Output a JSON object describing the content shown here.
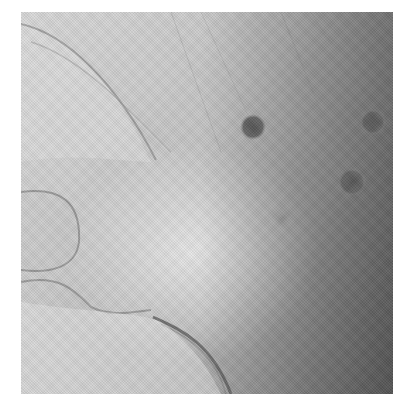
{
  "image": {
    "kind": "grayscale radiograph",
    "frame": {
      "x": 21,
      "y": 12,
      "width": 372,
      "height": 382
    },
    "palette": {
      "light": "#e6e6e6",
      "mid": "#b5b5b5",
      "dark": "#6e6e6e",
      "spot": "#5e5e5e"
    },
    "markers": [
      {
        "cx": 232,
        "cy": 115,
        "r": 13
      },
      {
        "cx": 352,
        "cy": 110,
        "r": 13
      },
      {
        "cx": 331,
        "cy": 170,
        "r": 14
      },
      {
        "cx": 262,
        "cy": 206,
        "r": 10,
        "faint": true
      }
    ]
  }
}
